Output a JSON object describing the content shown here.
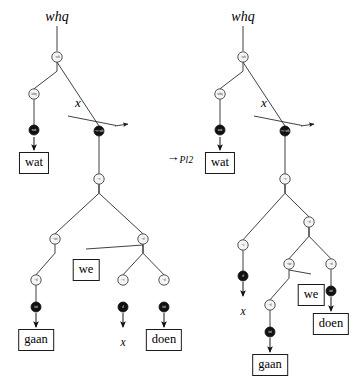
{
  "figure": {
    "type": "minimalist-grammar-derivation-trees",
    "operation_arrow": {
      "symbol": "→",
      "subscript": "Pl2",
      "x": 180,
      "y": 157
    },
    "node_radius": {
      "white": 5.2,
      "black": 5.0
    },
    "colors": {
      "line": "#2b2b2b",
      "white_node_fill": "#f4f4f4",
      "white_node_stroke": "#2b2b2b",
      "black_node_fill": "#111111",
      "text": "#000000",
      "box_border": "#1a1a1a"
    }
  },
  "trees": [
    {
      "id": "left-tree",
      "name": "source-derivation-tree",
      "root_label": {
        "text": "whq",
        "x": 57,
        "y": 17
      },
      "root_stem": {
        "x": 57,
        "y1": 26,
        "y2": 51
      },
      "nodes": [
        {
          "id": "L1",
          "label": "+wh",
          "type": "white",
          "x": 57,
          "y": 57
        },
        {
          "id": "L2",
          "label": "whq",
          "type": "white",
          "x": 34,
          "y": 94
        },
        {
          "id": "L3",
          "label": "wat",
          "type": "black",
          "x": 34,
          "y": 130
        },
        {
          "id": "L4",
          "label": "=v+wh",
          "type": "black",
          "x": 99,
          "y": 131
        },
        {
          "id": "L5",
          "label": "=v",
          "type": "white",
          "x": 99,
          "y": 179
        },
        {
          "id": "L6",
          "label": "=inf",
          "type": "white",
          "x": 55,
          "y": 239
        },
        {
          "id": "L7",
          "label": "=d",
          "type": "white",
          "x": 36,
          "y": 280
        },
        {
          "id": "L8",
          "label": "inf",
          "type": "black",
          "x": 36,
          "y": 307
        },
        {
          "id": "L9",
          "label": "=d",
          "type": "white",
          "x": 143,
          "y": 239
        },
        {
          "id": "L10",
          "label": "=v",
          "type": "white",
          "x": 123,
          "y": 280
        },
        {
          "id": "L11",
          "label": "d",
          "type": "black",
          "x": 123,
          "y": 307
        },
        {
          "id": "L12",
          "label": "=d",
          "type": "white",
          "x": 164,
          "y": 280
        },
        {
          "id": "L13",
          "label": "inf",
          "type": "black",
          "x": 164,
          "y": 307
        }
      ],
      "edges": [
        {
          "from": "L1",
          "to": "L2",
          "style": "elbow"
        },
        {
          "from": "L1",
          "to": "L4",
          "style": "straight-arrow"
        },
        {
          "from": "L2",
          "to": "L3",
          "style": "vertical"
        },
        {
          "from": "L4",
          "to": "L5",
          "style": "vertical"
        },
        {
          "from": "L5",
          "to": "L6",
          "style": "elbow"
        },
        {
          "from": "L5",
          "to": "L9",
          "style": "elbow"
        },
        {
          "from": "L6",
          "to": "L7",
          "style": "elbow"
        },
        {
          "from": "L7",
          "to": "L8",
          "style": "vertical"
        },
        {
          "from": "L9",
          "to": "L10",
          "style": "elbow"
        },
        {
          "from": "L9",
          "to": "L12",
          "style": "elbow"
        }
      ],
      "move_arrow": {
        "label": "x",
        "label_x": 78,
        "label_y": 103,
        "from_x": 68,
        "from_y": 116,
        "to_x": 128,
        "to_y": 124
      },
      "terminals": [
        {
          "kind": "box",
          "text": "wat",
          "x": 34,
          "y": 152,
          "arrow_from_y": 137,
          "arrow_to_y": 150,
          "arrow_x": 34
        },
        {
          "kind": "box",
          "text": "gaan",
          "x": 36,
          "y": 329,
          "arrow_from_y": 313,
          "arrow_to_y": 327,
          "arrow_x": 36
        },
        {
          "kind": "box",
          "text": "we",
          "x": 86,
          "y": 259,
          "arrow_from_y": 0,
          "arrow_to_y": 0,
          "arrow_x": 0
        },
        {
          "kind": "trace",
          "text": "x",
          "x": 123,
          "y": 336,
          "arrow_from_y": 313,
          "arrow_to_y": 327,
          "arrow_x": 123
        },
        {
          "kind": "box",
          "text": "doen",
          "x": 164,
          "y": 329,
          "arrow_from_y": 313,
          "arrow_to_y": 327,
          "arrow_x": 164
        }
      ],
      "plain_edges": [
        {
          "x1": 143,
          "y1": 245,
          "x2": 86,
          "y2": 249,
          "style": "elbow-to-box"
        }
      ]
    },
    {
      "id": "right-tree",
      "name": "result-derivation-tree",
      "root_label": {
        "text": "whq",
        "x": 243,
        "y": 17
      },
      "root_stem": {
        "x": 243,
        "y1": 26,
        "y2": 51
      },
      "nodes": [
        {
          "id": "R1",
          "label": "+wh",
          "type": "white",
          "x": 243,
          "y": 57
        },
        {
          "id": "R2",
          "label": "whq",
          "type": "white",
          "x": 220,
          "y": 94
        },
        {
          "id": "R3",
          "label": "wat",
          "type": "black",
          "x": 220,
          "y": 130
        },
        {
          "id": "R4",
          "label": "=v+wh",
          "type": "black",
          "x": 285,
          "y": 131
        },
        {
          "id": "R5",
          "label": "=v",
          "type": "white",
          "x": 285,
          "y": 179
        },
        {
          "id": "R6",
          "label": "=v",
          "type": "white",
          "x": 243,
          "y": 245
        },
        {
          "id": "R7",
          "label": "d",
          "type": "black",
          "x": 243,
          "y": 276
        },
        {
          "id": "R8",
          "label": "=d",
          "type": "white",
          "x": 309,
          "y": 222
        },
        {
          "id": "R9",
          "label": "=inf",
          "type": "white",
          "x": 289,
          "y": 264
        },
        {
          "id": "R10",
          "label": "=d",
          "type": "white",
          "x": 270,
          "y": 305
        },
        {
          "id": "R11",
          "label": "inf",
          "type": "black",
          "x": 270,
          "y": 332
        },
        {
          "id": "R12",
          "label": "=d",
          "type": "white",
          "x": 331,
          "y": 264
        },
        {
          "id": "R13",
          "label": "inf",
          "type": "black",
          "x": 331,
          "y": 291
        }
      ],
      "edges": [
        {
          "from": "R1",
          "to": "R2",
          "style": "elbow"
        },
        {
          "from": "R1",
          "to": "R4",
          "style": "straight-arrow"
        },
        {
          "from": "R2",
          "to": "R3",
          "style": "vertical"
        },
        {
          "from": "R4",
          "to": "R5",
          "style": "vertical"
        },
        {
          "from": "R5",
          "to": "R6",
          "style": "elbow"
        },
        {
          "from": "R5",
          "to": "R8",
          "style": "elbow"
        },
        {
          "from": "R6",
          "to": "R7",
          "style": "vertical"
        },
        {
          "from": "R8",
          "to": "R9",
          "style": "elbow"
        },
        {
          "from": "R8",
          "to": "R12",
          "style": "elbow"
        },
        {
          "from": "R9",
          "to": "R10",
          "style": "elbow"
        },
        {
          "from": "R10",
          "to": "R11",
          "style": "vertical"
        },
        {
          "from": "R12",
          "to": "R13",
          "style": "vertical"
        }
      ],
      "move_arrow": {
        "label": "x",
        "label_x": 264,
        "label_y": 103,
        "from_x": 254,
        "from_y": 116,
        "to_x": 314,
        "to_y": 124
      },
      "terminals": [
        {
          "kind": "box",
          "text": "wat",
          "x": 220,
          "y": 152,
          "arrow_from_y": 137,
          "arrow_to_y": 150,
          "arrow_x": 220
        },
        {
          "kind": "trace",
          "text": "x",
          "x": 243,
          "y": 305,
          "arrow_from_y": 282,
          "arrow_to_y": 296,
          "arrow_x": 243
        },
        {
          "kind": "box",
          "text": "we",
          "x": 311,
          "y": 284,
          "arrow_from_y": 0,
          "arrow_to_y": 0,
          "arrow_x": 0
        },
        {
          "kind": "box",
          "text": "gaan",
          "x": 270,
          "y": 354,
          "arrow_from_y": 338,
          "arrow_to_y": 352,
          "arrow_x": 270
        },
        {
          "kind": "box",
          "text": "doen",
          "x": 331,
          "y": 313,
          "arrow_from_y": 297,
          "arrow_to_y": 311,
          "arrow_x": 331
        }
      ],
      "plain_edges": [
        {
          "x1": 289,
          "y1": 270,
          "x2": 311,
          "y2": 274,
          "style": "elbow-to-box"
        }
      ]
    }
  ]
}
